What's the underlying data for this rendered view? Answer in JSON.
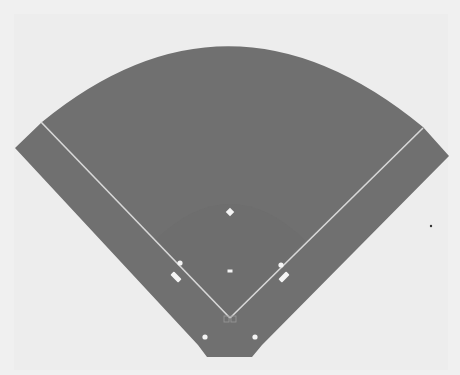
{
  "diagram": {
    "type": "baseball-field",
    "colors": {
      "background": "#f0f0f0",
      "field": "#707070",
      "infield_shade": "#6c6c6c",
      "lines": "#d8d8d8",
      "markers": "#f4f4f4",
      "stray_dot": "#333333"
    },
    "field_outline": {
      "left_tip": [
        15,
        148
      ],
      "arc_left": [
        42,
        122
      ],
      "arc_top": [
        230,
        44
      ],
      "arc_right": [
        423,
        127
      ],
      "right_tip": [
        449,
        156
      ],
      "bottom_right_corner": [
        262,
        345
      ],
      "bottom_right": [
        252,
        357
      ],
      "bottom_left": [
        207,
        357
      ],
      "bottom_left_corner": [
        198,
        345
      ]
    },
    "foul_lines": [
      {
        "name": "third-base-line",
        "from": [
          41,
          122
        ],
        "to": [
          230,
          318
        ]
      },
      {
        "name": "first-base-line",
        "from": [
          423,
          128
        ],
        "to": [
          230,
          318
        ]
      }
    ],
    "markers": [
      {
        "name": "second-base",
        "shape": "diamond",
        "x": 230,
        "y": 212,
        "size": 6
      },
      {
        "name": "pitchers-rubber",
        "shape": "rect",
        "x": 230,
        "y": 271,
        "w": 5,
        "h": 3
      },
      {
        "name": "third-base",
        "shape": "circle",
        "x": 180,
        "y": 263,
        "r": 2.6
      },
      {
        "name": "first-base",
        "shape": "circle",
        "x": 281,
        "y": 265,
        "r": 2.6
      },
      {
        "name": "third-base-coach-box",
        "shape": "bar",
        "x": 176,
        "y": 277,
        "w": 5,
        "h": 11,
        "angle": -45
      },
      {
        "name": "first-base-coach-box",
        "shape": "bar",
        "x": 284,
        "y": 277,
        "w": 5,
        "h": 11,
        "angle": 45
      },
      {
        "name": "left-on-deck-circle",
        "shape": "circle",
        "x": 205,
        "y": 337,
        "r": 2.6
      },
      {
        "name": "right-on-deck-circle",
        "shape": "circle",
        "x": 255,
        "y": 337,
        "r": 2.6
      }
    ],
    "home_plate": {
      "x": 230,
      "y": 318,
      "w": 12,
      "h": 6
    },
    "stray_dot": {
      "x": 431,
      "y": 226,
      "r": 1.2
    }
  }
}
